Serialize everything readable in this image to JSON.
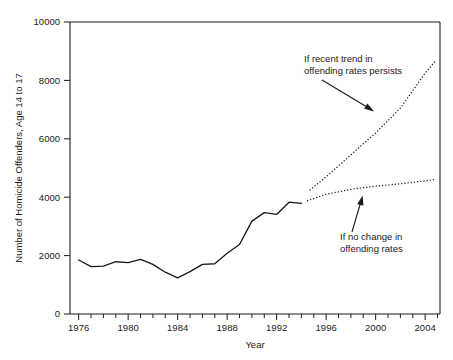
{
  "chart_data": {
    "type": "line",
    "title": "",
    "xlabel": "Year",
    "ylabel": "Number of Homicide Offenders, Age 14 to 17",
    "xlim": [
      1975.3,
      2005.2
    ],
    "ylim": [
      0,
      10000
    ],
    "grid": false,
    "legend": "none",
    "x_ticks_major": [
      1976,
      1980,
      1984,
      1988,
      1992,
      1996,
      2000,
      2004
    ],
    "x_tick_labels": [
      "1976",
      "1980",
      "1984",
      "1988",
      "1992",
      "1996",
      "2000",
      "2004"
    ],
    "x_ticks_minor": [
      1977,
      1978,
      1979,
      1981,
      1982,
      1983,
      1985,
      1986,
      1987,
      1989,
      1990,
      1991,
      1993,
      1994,
      1995,
      1997,
      1998,
      1999,
      2001,
      2002,
      2003,
      2005
    ],
    "y_ticks": [
      0,
      2000,
      4000,
      6000,
      8000,
      10000
    ],
    "y_tick_labels": [
      "0",
      "2000",
      "4000",
      "6000",
      "8000",
      "10000"
    ],
    "series": [
      {
        "name": "Actual homicide offenders age 14 to 17",
        "style": "solid",
        "x": [
          1976,
          1977,
          1978,
          1979,
          1980,
          1981,
          1982,
          1983,
          1984,
          1985,
          1986,
          1987,
          1988,
          1989,
          1990,
          1991,
          1992,
          1993,
          1994
        ],
        "values": [
          1850,
          1620,
          1640,
          1790,
          1760,
          1870,
          1700,
          1430,
          1240,
          1450,
          1700,
          1720,
          2080,
          2380,
          3180,
          3470,
          3410,
          3830,
          3790
        ]
      },
      {
        "name": "If recent trend in offending rates persists",
        "style": "dotted",
        "x": [
          1994.7,
          1996,
          1998,
          2000,
          2002,
          2004,
          2004.8
        ],
        "values": [
          4250,
          4700,
          5450,
          6200,
          7050,
          8250,
          8650
        ]
      },
      {
        "name": "If no change in offending rates",
        "style": "dotted",
        "x": [
          1994.5,
          1996,
          1998,
          2000,
          2002,
          2004,
          2004.8
        ],
        "values": [
          3880,
          4100,
          4270,
          4380,
          4460,
          4560,
          4610
        ]
      }
    ],
    "annotations": [
      {
        "id": "upper-annotation",
        "lines": [
          "If recent trend in",
          "offending rates persists"
        ],
        "text": "If recent trend in offending rates persists",
        "points_to": {
          "x": 2000.6,
          "y": 6900
        }
      },
      {
        "id": "lower-annotation",
        "lines": [
          "If no change in",
          "offending rates"
        ],
        "text": "If no change in offending rates",
        "points_to": {
          "x": 1999.3,
          "y": 4320
        }
      }
    ],
    "colors": {
      "line": "#1a1a1a",
      "axis": "#1a1a1a",
      "background": "#ffffff"
    }
  }
}
